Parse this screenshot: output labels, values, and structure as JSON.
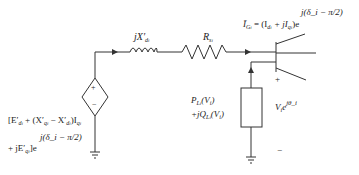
{
  "diagram": {
    "colors": {
      "line": "#333333",
      "background": "#ffffff"
    },
    "components": {
      "inductor": {
        "label_main": "jX",
        "label_prime": "′",
        "label_sub": "d",
        "label_subsub": "i"
      },
      "resistor": {
        "label_main": "R",
        "label_sub": "s",
        "label_subsub": "i"
      },
      "dependent_source": {
        "plus": "+",
        "minus": "−",
        "label_line1": "[E′d_i + (X′q_i − X′d_i)I q_i",
        "label_line2_prefix": "+ jE′q_i]e",
        "label_exponent": "j(δ_i − π/2)"
      },
      "current": {
        "label": "Ĩ G_i = (I d_i + jI q_i)e",
        "exponent": "j(δ_i − π/2)"
      },
      "load": {
        "label_line1": "P L_i(V_i)",
        "label_line2": "+jQ L_i(V_i)"
      },
      "bus_voltage": {
        "label": "V_i e",
        "exponent": "jθ_i",
        "plus": "+",
        "minus": "−"
      }
    },
    "text": {
      "jx": "jX",
      "prime": "′",
      "d": "d",
      "i": "i",
      "q": "q",
      "R": "R",
      "s": "s",
      "G": "G",
      "L": "L",
      "plus": "+",
      "minus": "−",
      "exp_delta": "j(δ",
      "exp_delta_tail": "− π/2)",
      "I_tilde": "Ĩ",
      "eq_open": " = (I",
      "plus_j_I": " + jI",
      "close_e": ")e",
      "E_open": "[E′",
      "plus_paren_X": " + (X′",
      "minus_X": " − X′",
      "close_I": ")I",
      "plus_jE": "+ jE′",
      "bracket_e": "]e",
      "P": "P",
      "jQ": "+jQ",
      "Vi_paren": "(V",
      "close_paren": ")",
      "V": "V",
      "e": "e",
      "j_theta": "jθ"
    }
  }
}
